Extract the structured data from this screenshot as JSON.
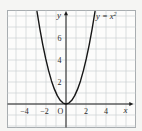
{
  "figure": {
    "bg_color": "#f5f5f3",
    "plot_bg": "#fcfcfb",
    "frame_color": "#a8adb0",
    "grid_color": "#ccd1d4",
    "axis_color": "#1c1c1c",
    "curve_color": "#161616",
    "text_color": "#2a2a2a"
  },
  "labels": {
    "equation_base": "y = x",
    "equation_exp": "2",
    "x_axis": "x",
    "y_axis": "y",
    "origin": "O"
  },
  "chart_data": {
    "type": "line",
    "equation": "y = x^2",
    "xlabel": "x",
    "ylabel": "y",
    "x_ticks": [
      -4,
      -2,
      2,
      4
    ],
    "y_ticks": [
      2,
      4,
      6
    ],
    "xlim": [
      -5.9,
      6.9
    ],
    "ylim": [
      -2.2,
      8.5
    ],
    "grid": true,
    "legend": false,
    "curve": {
      "name": "parabola",
      "x": [
        -2.9,
        -2.61,
        -2.32,
        -2.03,
        -1.74,
        -1.45,
        -1.16,
        -0.87,
        -0.58,
        -0.29,
        0,
        0.29,
        0.58,
        0.87,
        1.16,
        1.45,
        1.74,
        2.03,
        2.32,
        2.61,
        2.9
      ],
      "y": [
        8.41,
        6.81,
        5.38,
        4.12,
        3.03,
        2.1,
        1.35,
        0.76,
        0.34,
        0.08,
        0,
        0.08,
        0.34,
        0.76,
        1.35,
        2.1,
        3.03,
        4.12,
        5.38,
        6.81,
        8.41
      ]
    }
  }
}
